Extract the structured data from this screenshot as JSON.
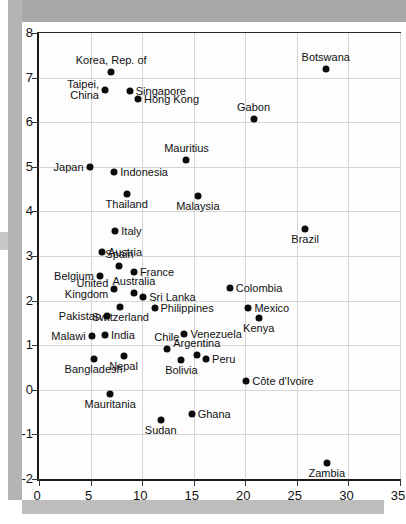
{
  "chart_data": {
    "type": "scatter",
    "title": "",
    "xlabel": "",
    "ylabel": "",
    "xlim": [
      0,
      35
    ],
    "ylim": [
      -2,
      8
    ],
    "xticks": [
      "0",
      "5",
      "10",
      "15",
      "20",
      "25",
      "30",
      "35"
    ],
    "yticks": [
      "8",
      "7",
      "6",
      "5",
      "4",
      "3",
      "2",
      "1",
      "0",
      "-1",
      "-2"
    ],
    "xtick_values": [
      0,
      5,
      10,
      15,
      20,
      25,
      30,
      35
    ],
    "ytick_values": [
      8,
      7,
      6,
      5,
      4,
      3,
      2,
      1,
      0,
      -1,
      -2
    ],
    "grid": true,
    "legend": "none",
    "marker_color": "#0b0b0b",
    "grid_color": "#d6d6d6",
    "axis_color": "#1a1a1a",
    "points": [
      {
        "label": "Korea, Rep. of",
        "x": 7.0,
        "y": 7.13,
        "pos": "above"
      },
      {
        "label": "Botswana",
        "x": 27.8,
        "y": 7.2,
        "pos": "above"
      },
      {
        "label": "Taipei,\nChina",
        "x": 6.4,
        "y": 6.72,
        "pos": "left"
      },
      {
        "label": "Singapore",
        "x": 8.8,
        "y": 6.7,
        "pos": "right"
      },
      {
        "label": "Hong Kong",
        "x": 9.6,
        "y": 6.52,
        "pos": "right"
      },
      {
        "label": "Gabon",
        "x": 20.8,
        "y": 6.07,
        "pos": "above"
      },
      {
        "label": "Mauritius",
        "x": 14.3,
        "y": 5.15,
        "pos": "above"
      },
      {
        "label": "Japan",
        "x": 4.9,
        "y": 5.0,
        "pos": "left"
      },
      {
        "label": "Indonesia",
        "x": 7.3,
        "y": 4.88,
        "pos": "right"
      },
      {
        "label": "Thailand",
        "x": 8.5,
        "y": 4.38,
        "pos": "below"
      },
      {
        "label": "Malaysia",
        "x": 15.4,
        "y": 4.35,
        "pos": "below"
      },
      {
        "label": "Italy",
        "x": 7.4,
        "y": 3.55,
        "pos": "right"
      },
      {
        "label": "Brazil",
        "x": 25.8,
        "y": 3.6,
        "pos": "below"
      },
      {
        "label": "Austria",
        "x": 6.1,
        "y": 3.1,
        "pos": "right"
      },
      {
        "label": "Spain",
        "x": 7.8,
        "y": 2.77,
        "pos": "above"
      },
      {
        "label": "France",
        "x": 9.2,
        "y": 2.65,
        "pos": "right"
      },
      {
        "label": "Belgium",
        "x": 5.9,
        "y": 2.55,
        "pos": "left"
      },
      {
        "label": "Australia",
        "x": 9.2,
        "y": 2.17,
        "pos": "above"
      },
      {
        "label": "United\nKingdom",
        "x": 7.3,
        "y": 2.25,
        "pos": "left"
      },
      {
        "label": "Sri Lanka",
        "x": 10.1,
        "y": 2.08,
        "pos": "right"
      },
      {
        "label": "Colombia",
        "x": 18.5,
        "y": 2.29,
        "pos": "right"
      },
      {
        "label": "Switzerland",
        "x": 7.9,
        "y": 1.85,
        "pos": "below"
      },
      {
        "label": "Philippines",
        "x": 11.2,
        "y": 1.83,
        "pos": "right"
      },
      {
        "label": "Mexico",
        "x": 20.3,
        "y": 1.83,
        "pos": "right"
      },
      {
        "label": "Pakistan",
        "x": 6.6,
        "y": 1.65,
        "pos": "left"
      },
      {
        "label": "Kenya",
        "x": 21.3,
        "y": 1.6,
        "pos": "below"
      },
      {
        "label": "Venezuela",
        "x": 14.1,
        "y": 1.25,
        "pos": "right"
      },
      {
        "label": "Malawi",
        "x": 5.1,
        "y": 1.2,
        "pos": "left"
      },
      {
        "label": "India",
        "x": 6.4,
        "y": 1.22,
        "pos": "right"
      },
      {
        "label": "Chile",
        "x": 12.4,
        "y": 0.92,
        "pos": "above"
      },
      {
        "label": "Argentina",
        "x": 15.3,
        "y": 0.78,
        "pos": "above"
      },
      {
        "label": "Peru",
        "x": 16.2,
        "y": 0.7,
        "pos": "right"
      },
      {
        "label": "Nepal",
        "x": 8.2,
        "y": 0.75,
        "pos": "below"
      },
      {
        "label": "Bangladesh",
        "x": 5.3,
        "y": 0.7,
        "pos": "below"
      },
      {
        "label": "Bolivia",
        "x": 13.8,
        "y": 0.67,
        "pos": "below"
      },
      {
        "label": "Côte d'Ivoire",
        "x": 20.1,
        "y": 0.2,
        "pos": "right"
      },
      {
        "label": "Mauritania",
        "x": 6.9,
        "y": -0.1,
        "pos": "below"
      },
      {
        "label": "Ghana",
        "x": 14.8,
        "y": -0.55,
        "pos": "right"
      },
      {
        "label": "Sudan",
        "x": 11.8,
        "y": -0.68,
        "pos": "below"
      },
      {
        "label": "Zambia",
        "x": 27.9,
        "y": -1.65,
        "pos": "below"
      }
    ]
  }
}
